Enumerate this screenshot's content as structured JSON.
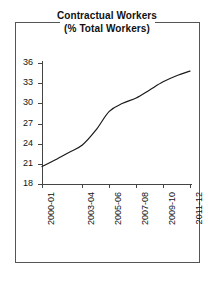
{
  "figure": {
    "background_color": "#ffffff",
    "frame_color": "#555555",
    "axis_color": "#444444"
  },
  "title": {
    "line1": "Contractual Workers",
    "line2": "(% Total Workers)"
  },
  "chart_data": {
    "type": "line",
    "title": "Contractual Workers (% Total Workers)",
    "xlabel": "",
    "ylabel": "",
    "categories": [
      "2000-01",
      "2001-02",
      "2002-03",
      "2003-04",
      "2004-05",
      "2005-06",
      "2006-07",
      "2007-08",
      "2008-09",
      "2009-10",
      "2010-11",
      "2011-12"
    ],
    "tick_labels": [
      "2000-01",
      "2003-04",
      "2005-06",
      "2007-08",
      "2009-10",
      "2011-12"
    ],
    "values": [
      20.6,
      21.6,
      22.7,
      23.8,
      26.0,
      28.8,
      30.0,
      30.8,
      32.0,
      33.2,
      34.1,
      34.8
    ],
    "series": [
      {
        "name": "Contractual Workers",
        "color": "#1a1a1a",
        "values": [
          20.6,
          21.6,
          22.7,
          23.8,
          26.0,
          28.8,
          30.0,
          30.8,
          32.0,
          33.2,
          34.1,
          34.8
        ]
      }
    ],
    "ylim": [
      18,
      36
    ],
    "yticks": [
      18,
      21,
      24,
      27,
      30,
      33,
      36
    ],
    "ytick_labels": [
      "18",
      "21",
      "24",
      "27",
      "30",
      "33",
      "36"
    ],
    "grid": false,
    "legend": false,
    "legend_position": "none",
    "line_color": "#1a1a1a",
    "line_width": 1.2
  },
  "axes": {
    "y": {
      "ticks": [
        {
          "value": 36,
          "label": "36"
        },
        {
          "value": 33,
          "label": "33"
        },
        {
          "value": 30,
          "label": "30"
        },
        {
          "value": 27,
          "label": "27"
        },
        {
          "value": 24,
          "label": "24"
        },
        {
          "value": 21,
          "label": "21"
        },
        {
          "value": 18,
          "label": "18"
        }
      ]
    },
    "x": {
      "ticks": [
        {
          "label": "2000-01",
          "position": 0.0
        },
        {
          "label": "2003-04",
          "position": 0.2727
        },
        {
          "label": "2005-06",
          "position": 0.4545
        },
        {
          "label": "2007-08",
          "position": 0.6364
        },
        {
          "label": "2009-10",
          "position": 0.8182
        },
        {
          "label": "2011-12",
          "position": 1.0
        }
      ]
    }
  }
}
